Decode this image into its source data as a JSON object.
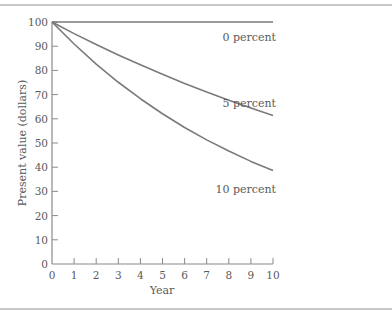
{
  "chart_data": {
    "type": "line",
    "title": "",
    "xlabel": "Year",
    "ylabel": "Present value (dollars)",
    "xlim": [
      0,
      10
    ],
    "ylim": [
      0,
      100
    ],
    "x_ticks": [
      0,
      1,
      2,
      3,
      4,
      5,
      6,
      7,
      8,
      9,
      10
    ],
    "y_ticks": [
      0,
      10,
      20,
      30,
      40,
      50,
      60,
      70,
      80,
      90,
      100
    ],
    "grid": false,
    "legend": "inline labels at right end of each curve",
    "x": [
      0,
      1,
      2,
      3,
      4,
      5,
      6,
      7,
      8,
      9,
      10
    ],
    "series": [
      {
        "name": "0 percent",
        "values": [
          100,
          100,
          100,
          100,
          100,
          100,
          100,
          100,
          100,
          100,
          100
        ]
      },
      {
        "name": "5 percent",
        "values": [
          100,
          95.2,
          90.7,
          86.4,
          82.3,
          78.4,
          74.6,
          71.1,
          67.7,
          64.5,
          61.4
        ]
      },
      {
        "name": "10 percent",
        "values": [
          100,
          90.9,
          82.6,
          75.1,
          68.3,
          62.1,
          56.4,
          51.3,
          46.7,
          42.4,
          38.6
        ]
      }
    ],
    "line_color": "#7a7a7a"
  },
  "labels": {
    "xlabel": "Year",
    "ylabel": "Present value (dollars)",
    "series0": "0 percent",
    "series1": "5 percent",
    "series2": "10 percent"
  }
}
